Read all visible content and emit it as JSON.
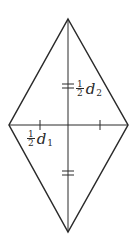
{
  "figure": {
    "colors": {
      "stroke": "#2a2a2a",
      "background": "#ffffff"
    },
    "vertices": {
      "top": [
        68,
        19
      ],
      "right": [
        128,
        125
      ],
      "bottom": [
        68,
        232
      ],
      "left": [
        9,
        125
      ]
    },
    "diagonals": {
      "vertical": {
        "from": [
          68,
          19
        ],
        "to": [
          68,
          232
        ]
      },
      "horizontal": {
        "from": [
          9,
          125
        ],
        "to": [
          128,
          125
        ]
      }
    },
    "tick_marks": {
      "vertical_upper_double_at_y": 86,
      "vertical_lower_double_at_y": 173,
      "horizontal_left_single_at_x": 40,
      "horizontal_right_single_at_x": 100
    },
    "labels": {
      "half_d2": {
        "numerator": "1",
        "denominator": "2",
        "variable": "d",
        "subscript": "2"
      },
      "half_d1": {
        "numerator": "1",
        "denominator": "2",
        "variable": "d",
        "subscript": "1"
      }
    }
  }
}
